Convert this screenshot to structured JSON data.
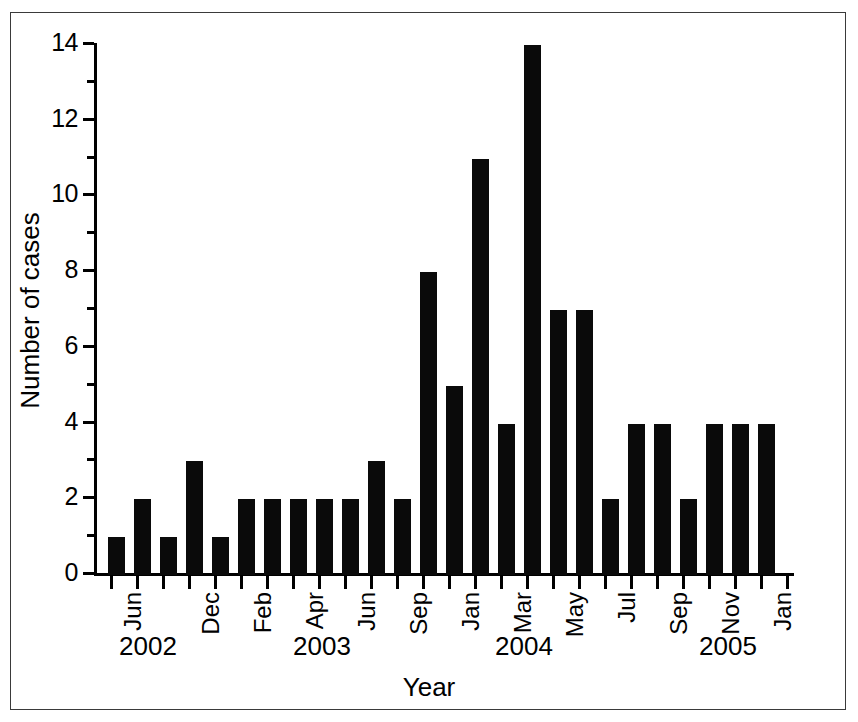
{
  "chart_data": {
    "type": "bar",
    "title": "",
    "xlabel": "Year",
    "ylabel": "Number of cases",
    "ylim": [
      0,
      14
    ],
    "y_ticks_major": [
      0,
      2,
      4,
      6,
      8,
      10,
      12,
      14
    ],
    "y_ticks_minor": [
      1,
      3,
      5,
      7,
      9,
      11,
      13
    ],
    "grid": false,
    "legend": null,
    "bar_color": "#000000",
    "background_color": "#ffffff",
    "axis_color": "#000000",
    "x_axis_kind": "monthly",
    "x_start": "2002-06",
    "x_end": "2005-03",
    "categories": [
      "Jun 2002",
      "Jul 2002",
      "Aug 2002",
      "Sep 2002",
      "Oct 2002",
      "Nov 2002",
      "Dec 2002",
      "Jan 2003",
      "Feb 2003",
      "Mar 2003",
      "Apr 2003",
      "May 2003",
      "Jun 2003",
      "Jul 2003",
      "Aug 2003",
      "Sep 2003",
      "Oct 2003",
      "Nov 2003",
      "Dec 2003",
      "Jan 2004",
      "Feb 2004",
      "Mar 2004",
      "Apr 2004",
      "May 2004",
      "Jun 2004",
      "Jul 2004",
      "Aug 2004",
      "Sep 2004",
      "Oct 2004",
      "Nov 2004",
      "Dec 2004",
      "Jan 2005",
      "Feb 2005",
      "Mar 2005"
    ],
    "values": [
      1,
      0,
      2,
      0,
      1,
      0,
      3,
      0,
      1,
      0,
      2,
      2,
      2,
      2,
      2,
      3,
      2,
      0,
      8,
      5,
      11,
      4,
      14,
      7,
      7,
      0,
      2,
      4,
      4,
      2,
      4,
      4,
      4,
      0
    ],
    "bars_drawn": [
      {
        "index": 0,
        "value": 1,
        "x_px": 108
      },
      {
        "index": 1,
        "value": 2,
        "x_px": 134
      },
      {
        "index": 2,
        "value": 1,
        "x_px": 160
      },
      {
        "index": 3,
        "value": 3,
        "x_px": 186
      },
      {
        "index": 4,
        "value": 1,
        "x_px": 212
      },
      {
        "index": 5,
        "value": 2,
        "x_px": 238
      },
      {
        "index": 6,
        "value": 2,
        "x_px": 264
      },
      {
        "index": 7,
        "value": 2,
        "x_px": 290
      },
      {
        "index": 8,
        "value": 2,
        "x_px": 316
      },
      {
        "index": 9,
        "value": 2,
        "x_px": 342
      },
      {
        "index": 10,
        "value": 3,
        "x_px": 368
      },
      {
        "index": 11,
        "value": 2,
        "x_px": 394
      },
      {
        "index": 12,
        "value": 8,
        "x_px": 420
      },
      {
        "index": 13,
        "value": 5,
        "x_px": 446
      },
      {
        "index": 14,
        "value": 11,
        "x_px": 472
      },
      {
        "index": 15,
        "value": 4,
        "x_px": 498
      },
      {
        "index": 16,
        "value": 14,
        "x_px": 524
      },
      {
        "index": 17,
        "value": 7,
        "x_px": 550
      },
      {
        "index": 18,
        "value": 7,
        "x_px": 576
      },
      {
        "index": 19,
        "value": 2,
        "x_px": 602
      },
      {
        "index": 20,
        "value": 4,
        "x_px": 628
      },
      {
        "index": 21,
        "value": 4,
        "x_px": 654
      },
      {
        "index": 22,
        "value": 2,
        "x_px": 680
      },
      {
        "index": 23,
        "value": 4,
        "x_px": 706
      },
      {
        "index": 24,
        "value": 4,
        "x_px": 732
      },
      {
        "index": 25,
        "value": 4,
        "x_px": 758
      }
    ],
    "x_month_ticks": [
      {
        "label": "Jun",
        "x_px": 110
      },
      {
        "label": "",
        "x_px": 136
      },
      {
        "label": "",
        "x_px": 162
      },
      {
        "label": "Dec",
        "x_px": 188
      },
      {
        "label": "",
        "x_px": 214
      },
      {
        "label": "Feb",
        "x_px": 240
      },
      {
        "label": "",
        "x_px": 266
      },
      {
        "label": "Apr",
        "x_px": 292
      },
      {
        "label": "",
        "x_px": 318
      },
      {
        "label": "Jun",
        "x_px": 344
      },
      {
        "label": "",
        "x_px": 370
      },
      {
        "label": "Sep",
        "x_px": 396
      },
      {
        "label": "",
        "x_px": 422
      },
      {
        "label": "Jan",
        "x_px": 448
      },
      {
        "label": "",
        "x_px": 474
      },
      {
        "label": "Mar",
        "x_px": 500
      },
      {
        "label": "",
        "x_px": 526
      },
      {
        "label": "May",
        "x_px": 552
      },
      {
        "label": "",
        "x_px": 578
      },
      {
        "label": "Jul",
        "x_px": 604
      },
      {
        "label": "",
        "x_px": 630
      },
      {
        "label": "Sep",
        "x_px": 656
      },
      {
        "label": "",
        "x_px": 682
      },
      {
        "label": "Nov",
        "x_px": 708
      },
      {
        "label": "",
        "x_px": 734
      },
      {
        "label": "Jan",
        "x_px": 760
      },
      {
        "label": "",
        "x_px": 786
      }
    ],
    "x_year_labels": [
      {
        "label": "2002",
        "x_px": 148
      },
      {
        "label": "2003",
        "x_px": 322
      },
      {
        "label": "2004",
        "x_px": 524
      },
      {
        "label": "2005",
        "x_px": 728
      }
    ]
  }
}
